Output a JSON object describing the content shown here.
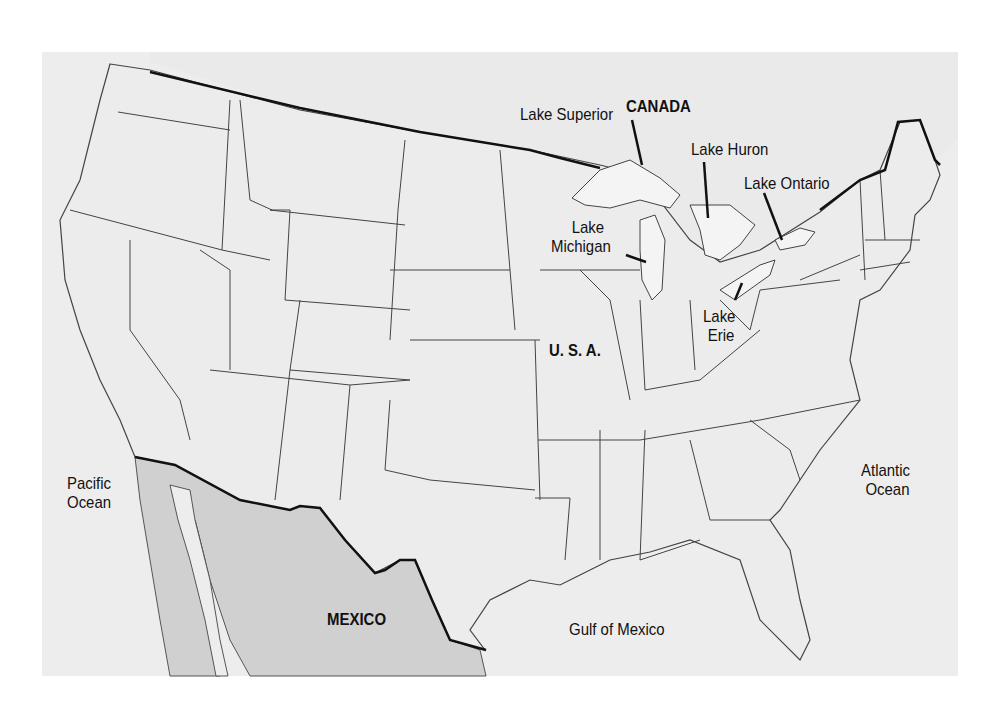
{
  "map": {
    "title": "Map of the United States",
    "colors": {
      "background": "#ffffff",
      "ocean": "#ededed",
      "land_usa": "#ececec",
      "land_canada": "#eaeaea",
      "land_mexico": "#d0d0d0",
      "state_border": "#444444",
      "national_border": "#111111"
    },
    "labels": {
      "canada": "CANADA",
      "usa": "U. S. A.",
      "mexico": "MEXICO",
      "pacific_line1": "Pacific",
      "pacific_line2": "Ocean",
      "atlantic_line1": "Atlantic",
      "atlantic_line2": "Ocean",
      "gulf": "Gulf of Mexico",
      "lake_superior": "Lake Superior",
      "lake_huron": "Lake Huron",
      "lake_ontario": "Lake Ontario",
      "lake_michigan_line1": "Lake",
      "lake_michigan_line2": "Michigan",
      "lake_erie_line1": "Lake",
      "lake_erie_line2": "Erie"
    }
  }
}
